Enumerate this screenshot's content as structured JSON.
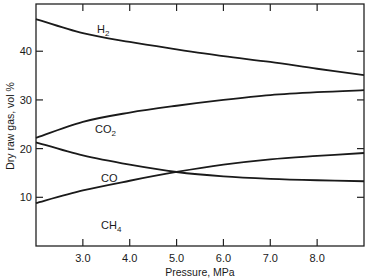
{
  "chart_data": {
    "type": "line",
    "title": "",
    "xlabel": "Pressure, MPa",
    "ylabel": "Dry raw gas, vol %",
    "xlim": [
      2.0,
      9.0
    ],
    "ylim": [
      0,
      49.7
    ],
    "xticks": [
      3.0,
      4.0,
      5.0,
      6.0,
      7.0,
      8.0
    ],
    "xtick_labels": [
      "3.0",
      "4.0",
      "5.0",
      "6.0",
      "7.0",
      "8.0"
    ],
    "yticks": [
      10,
      20,
      30,
      40
    ],
    "ytick_labels": [
      "10",
      "20",
      "30",
      "40"
    ],
    "grid": false,
    "legend": "inline labels",
    "x": [
      2.0,
      3.0,
      4.0,
      5.0,
      6.0,
      7.0,
      8.0,
      9.0
    ],
    "series": [
      {
        "name": "H2",
        "label_main": "H",
        "label_sub": "2",
        "values": [
          46.6,
          43.7,
          41.9,
          40.4,
          39.0,
          37.8,
          36.4,
          35.1
        ]
      },
      {
        "name": "CO2",
        "label_main": "CO",
        "label_sub": "2",
        "values": [
          22.2,
          25.5,
          27.4,
          28.8,
          30.0,
          31.0,
          31.6,
          32.0
        ]
      },
      {
        "name": "CO",
        "label_main": "CO",
        "label_sub": "",
        "values": [
          21.3,
          18.6,
          16.7,
          15.2,
          14.3,
          13.8,
          13.5,
          13.3
        ]
      },
      {
        "name": "CH4",
        "label_main": "CH",
        "label_sub": "4",
        "values": [
          8.8,
          11.4,
          13.4,
          15.2,
          16.7,
          17.8,
          18.5,
          19.1
        ]
      }
    ]
  },
  "labels": {
    "x_axis": "Pressure, MPa",
    "y_axis": "Dry raw gas, vol %"
  }
}
